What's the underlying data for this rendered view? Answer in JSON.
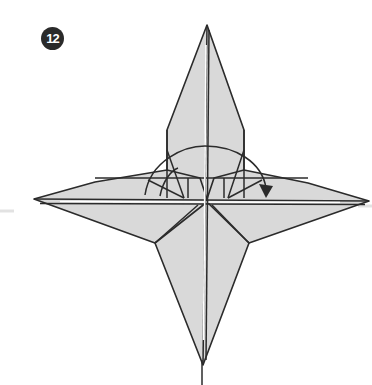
{
  "step": {
    "number": "12"
  },
  "diagram": {
    "colors": {
      "paper": "#d9d9d9",
      "line": "#2b2b2b",
      "badge": "#2a2a2a",
      "background": "#ffffff"
    },
    "points": {
      "top": [
        207,
        25
      ],
      "bottom": [
        203,
        365
      ],
      "left": [
        34,
        199
      ],
      "right": [
        369,
        201
      ]
    },
    "arrow": {
      "type": "valley-fold-arc",
      "direction": "left-to-right",
      "start": [
        145,
        195
      ],
      "end": [
        267,
        195
      ]
    }
  }
}
